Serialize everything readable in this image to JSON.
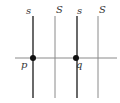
{
  "diagram": {
    "vertical_lines": [
      {
        "label": "s",
        "x": 33,
        "thick": true
      },
      {
        "label": "S",
        "x": 55,
        "thick": false
      },
      {
        "label": "s",
        "x": 77,
        "thick": true
      },
      {
        "label": "S",
        "x": 98,
        "thick": false
      }
    ],
    "horizontal_line": {
      "y": 58,
      "x1": 15,
      "x2": 117
    },
    "points": [
      {
        "label": "p",
        "x": 33,
        "y": 58
      },
      {
        "label": "q",
        "x": 76,
        "y": 58
      }
    ],
    "colors": {
      "line": "#555555",
      "thin_line": "#8a8a8a",
      "point": "#111111"
    }
  }
}
